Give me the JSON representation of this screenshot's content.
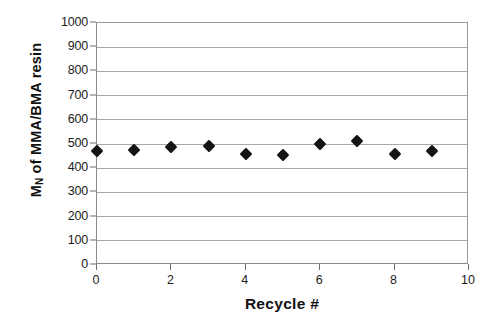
{
  "chart_data": {
    "type": "scatter",
    "title": "",
    "xlabel": "Recycle #",
    "ylabel_html": "M<sub>N</sub> of MMA/BMA resin",
    "ylabel_text": "MN of MMA/BMA resin",
    "x": [
      0,
      1,
      2,
      3,
      4,
      5,
      6,
      7,
      8,
      9
    ],
    "values": [
      470,
      475,
      487,
      490,
      458,
      455,
      500,
      512,
      458,
      470
    ],
    "series": [
      {
        "name": "Mn of MMA/BMA resin",
        "x": [
          0,
          1,
          2,
          3,
          4,
          5,
          6,
          7,
          8,
          9
        ],
        "values": [
          470,
          475,
          487,
          490,
          458,
          455,
          500,
          512,
          458,
          470
        ],
        "marker": "diamond",
        "color": "#141414"
      }
    ],
    "xlim": [
      0,
      10
    ],
    "ylim": [
      0,
      1000
    ],
    "xticks": [
      0,
      2,
      4,
      6,
      8,
      10
    ],
    "xtick_labels": [
      "0",
      "2",
      "4",
      "6",
      "8",
      "10"
    ],
    "yticks": [
      0,
      100,
      200,
      300,
      400,
      500,
      600,
      700,
      800,
      900,
      1000
    ],
    "ytick_labels": [
      "0",
      "100",
      "200",
      "300",
      "400",
      "500",
      "600",
      "700",
      "800",
      "900",
      "1000"
    ],
    "grid": "horizontal",
    "legend": "none",
    "gridline_color": "#a9a9a9",
    "frame_color": "#8a8a8a",
    "background": "#ffffff"
  }
}
